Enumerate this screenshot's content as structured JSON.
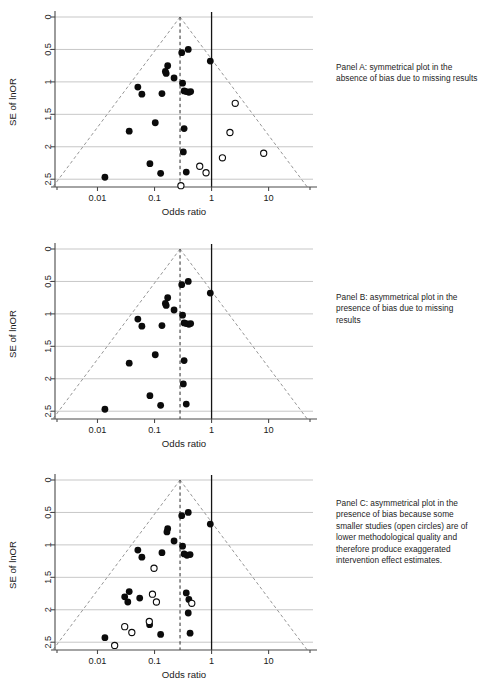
{
  "figure": {
    "axis": {
      "xlabel": "Odds ratio",
      "ylabel": "SE of lnOR",
      "xticks": [
        "0.01",
        "0.1",
        "1",
        "10"
      ],
      "yticks": [
        "0",
        "0.5",
        "1",
        "1.5",
        "2",
        "2.5"
      ]
    }
  },
  "panels": [
    {
      "id": "A",
      "caption": "Panel A: symmetrical plot in the absence of bias due to missing results"
    },
    {
      "id": "B",
      "caption": "Panel B: asymmetrical plot in the presence of bias due to missing results"
    },
    {
      "id": "C",
      "caption": "Panel C: asymmetrical plot in the presence of bias because some smaller studies (open circles) are of lower methodological quality and therefore produce exaggerated intervention effect estimates."
    }
  ],
  "chart_data": [
    {
      "type": "scatter",
      "panel": "A",
      "title": "Panel A: symmetrical plot in the absence of bias due to missing results",
      "xlabel": "Odds ratio",
      "ylabel": "SE of lnOR",
      "xscale": "log",
      "xlim": [
        0.0018,
        60
      ],
      "ylim": [
        0,
        2.62
      ],
      "y_inverted": true,
      "xticks": [
        0.01,
        0.1,
        1,
        10
      ],
      "yticks": [
        0,
        0.5,
        1,
        1.5,
        2,
        2.5
      ],
      "grid": "horizontal",
      "pooled_or": 0.28,
      "null_or": 1.0,
      "funnel_contour": "95% pseudo confidence limits, apex at (0.28, 0)",
      "series": [
        {
          "name": "observed studies",
          "marker": "filled-circle",
          "points": [
            {
              "or": 0.3,
              "se": 0.55
            },
            {
              "or": 0.39,
              "se": 0.5
            },
            {
              "or": 0.95,
              "se": 0.68
            },
            {
              "or": 0.17,
              "se": 0.75
            },
            {
              "or": 0.155,
              "se": 0.84
            },
            {
              "or": 0.16,
              "se": 0.87
            },
            {
              "or": 0.22,
              "se": 0.94
            },
            {
              "or": 0.31,
              "se": 1.02
            },
            {
              "or": 0.051,
              "se": 1.08
            },
            {
              "or": 0.06,
              "se": 1.19
            },
            {
              "or": 0.135,
              "se": 1.18
            },
            {
              "or": 0.33,
              "se": 1.14
            },
            {
              "or": 0.36,
              "se": 1.15
            },
            {
              "or": 0.4,
              "se": 1.16
            },
            {
              "or": 0.43,
              "se": 1.15
            },
            {
              "or": 0.103,
              "se": 1.63
            },
            {
              "or": 0.036,
              "se": 1.76
            },
            {
              "or": 0.33,
              "se": 1.72
            },
            {
              "or": 0.32,
              "se": 2.08
            },
            {
              "or": 0.083,
              "se": 2.26
            },
            {
              "or": 0.128,
              "se": 2.41
            },
            {
              "or": 0.36,
              "se": 2.39
            },
            {
              "or": 0.0135,
              "se": 2.47
            }
          ]
        },
        {
          "name": "missing studies",
          "marker": "open-circle",
          "points": [
            {
              "or": 2.6,
              "se": 1.33
            },
            {
              "or": 2.1,
              "se": 1.78
            },
            {
              "or": 1.55,
              "se": 2.17
            },
            {
              "or": 8.2,
              "se": 2.1
            },
            {
              "or": 0.62,
              "se": 2.3
            },
            {
              "or": 0.8,
              "se": 2.4
            },
            {
              "or": 0.29,
              "se": 2.6
            }
          ]
        }
      ]
    },
    {
      "type": "scatter",
      "panel": "B",
      "title": "Panel B: asymmetrical plot in the presence of bias due to missing results",
      "xlabel": "Odds ratio",
      "ylabel": "SE of lnOR",
      "xscale": "log",
      "xlim": [
        0.0018,
        60
      ],
      "ylim": [
        0,
        2.62
      ],
      "y_inverted": true,
      "xticks": [
        0.01,
        0.1,
        1,
        10
      ],
      "yticks": [
        0,
        0.5,
        1,
        1.5,
        2,
        2.5
      ],
      "grid": "horizontal",
      "pooled_or": 0.28,
      "null_or": 1.0,
      "funnel_contour": "95% pseudo confidence limits, apex at (0.28, 0)",
      "series": [
        {
          "name": "observed studies",
          "marker": "filled-circle",
          "points": [
            {
              "or": 0.3,
              "se": 0.55
            },
            {
              "or": 0.39,
              "se": 0.5
            },
            {
              "or": 0.95,
              "se": 0.68
            },
            {
              "or": 0.17,
              "se": 0.75
            },
            {
              "or": 0.155,
              "se": 0.84
            },
            {
              "or": 0.16,
              "se": 0.87
            },
            {
              "or": 0.22,
              "se": 0.94
            },
            {
              "or": 0.31,
              "se": 1.02
            },
            {
              "or": 0.051,
              "se": 1.08
            },
            {
              "or": 0.06,
              "se": 1.19
            },
            {
              "or": 0.135,
              "se": 1.18
            },
            {
              "or": 0.33,
              "se": 1.14
            },
            {
              "or": 0.36,
              "se": 1.15
            },
            {
              "or": 0.4,
              "se": 1.16
            },
            {
              "or": 0.43,
              "se": 1.15
            },
            {
              "or": 0.103,
              "se": 1.63
            },
            {
              "or": 0.036,
              "se": 1.76
            },
            {
              "or": 0.33,
              "se": 1.72
            },
            {
              "or": 0.32,
              "se": 2.08
            },
            {
              "or": 0.083,
              "se": 2.26
            },
            {
              "or": 0.128,
              "se": 2.41
            },
            {
              "or": 0.36,
              "se": 2.39
            },
            {
              "or": 0.0135,
              "se": 2.47
            }
          ]
        }
      ]
    },
    {
      "type": "scatter",
      "panel": "C",
      "title": "Panel C: asymmetrical plot in the presence of bias because some smaller studies (open circles) are of lower methodological quality and therefore produce exaggerated intervention effect estimates.",
      "xlabel": "Odds ratio",
      "ylabel": "SE of lnOR",
      "xscale": "log",
      "xlim": [
        0.0018,
        60
      ],
      "ylim": [
        0,
        2.62
      ],
      "y_inverted": true,
      "xticks": [
        0.01,
        0.1,
        1,
        10
      ],
      "yticks": [
        0,
        0.5,
        1,
        1.5,
        2,
        2.5
      ],
      "grid": "horizontal",
      "pooled_or": 0.28,
      "null_or": 1.0,
      "funnel_contour": "95% pseudo confidence limits, apex at (0.28, 0)",
      "series": [
        {
          "name": "higher quality studies",
          "marker": "filled-circle",
          "points": [
            {
              "or": 0.3,
              "se": 0.55
            },
            {
              "or": 0.39,
              "se": 0.5
            },
            {
              "or": 0.95,
              "se": 0.68
            },
            {
              "or": 0.17,
              "se": 0.75
            },
            {
              "or": 0.165,
              "se": 0.8
            },
            {
              "or": 0.22,
              "se": 0.94
            },
            {
              "or": 0.31,
              "se": 1.02
            },
            {
              "or": 0.051,
              "se": 1.08
            },
            {
              "or": 0.06,
              "se": 1.19
            },
            {
              "or": 0.135,
              "se": 1.12
            },
            {
              "or": 0.33,
              "se": 1.14
            },
            {
              "or": 0.37,
              "se": 1.16
            },
            {
              "or": 0.42,
              "se": 1.15
            },
            {
              "or": 0.036,
              "se": 1.72
            },
            {
              "or": 0.03,
              "se": 1.8
            },
            {
              "or": 0.36,
              "se": 1.74
            },
            {
              "or": 0.055,
              "se": 1.82
            },
            {
              "or": 0.034,
              "se": 1.88
            },
            {
              "or": 0.4,
              "se": 1.84
            },
            {
              "or": 0.39,
              "se": 2.05
            },
            {
              "or": 0.082,
              "se": 2.23
            },
            {
              "or": 0.128,
              "se": 2.38
            },
            {
              "or": 0.42,
              "se": 2.36
            },
            {
              "or": 0.0135,
              "se": 2.43
            }
          ]
        },
        {
          "name": "lower quality studies",
          "marker": "open-circle",
          "points": [
            {
              "or": 0.098,
              "se": 1.36
            },
            {
              "or": 0.092,
              "se": 1.76
            },
            {
              "or": 0.108,
              "se": 1.88
            },
            {
              "or": 0.45,
              "se": 1.9
            },
            {
              "or": 0.081,
              "se": 2.18
            },
            {
              "or": 0.03,
              "se": 2.26
            },
            {
              "or": 0.04,
              "se": 2.35
            },
            {
              "or": 0.02,
              "se": 2.55
            }
          ]
        }
      ]
    }
  ]
}
